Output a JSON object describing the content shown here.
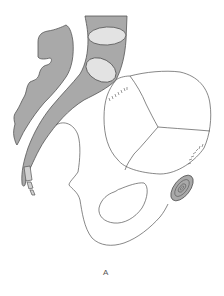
{
  "figure": {
    "panel_label": "A",
    "colors": {
      "tissue_fill": "#a9a9a9",
      "vertebra_fill": "#e3e3e3",
      "outline": "#555555",
      "background": "#ffffff"
    },
    "parts": [
      "anterior-wall",
      "posterior-column",
      "upper-vertebra",
      "lower-vertebra",
      "coccyx",
      "fetal-head",
      "pelvic-bone",
      "obturator-foramen",
      "pubic-symphysis"
    ]
  }
}
